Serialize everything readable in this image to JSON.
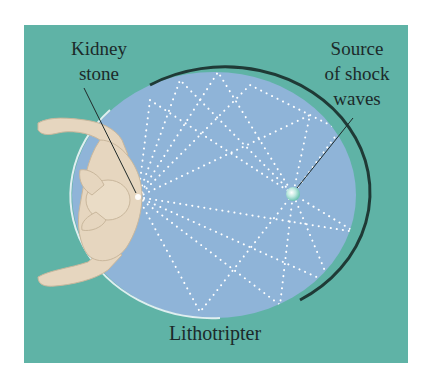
{
  "figure": {
    "labels": {
      "kidney_stone": [
        "Kidney",
        "stone"
      ],
      "source": [
        "Source",
        "of shock",
        "waves"
      ],
      "device": "Lithotripter"
    },
    "colors": {
      "background_panel": "#5fb3a6",
      "ellipse_fill": "#8fb4d8",
      "ellipse_rim_dark": "#1f3a36",
      "ellipse_rim_light": "#dfeef0",
      "wave_dots": "#ffffff",
      "body_skin": "#e6d6bf",
      "text": "#1c2a2a"
    },
    "elements": {
      "focus_stone": "kidney stone at left focus of ellipse",
      "focus_source": "shock wave source at right focus of ellipse"
    }
  }
}
